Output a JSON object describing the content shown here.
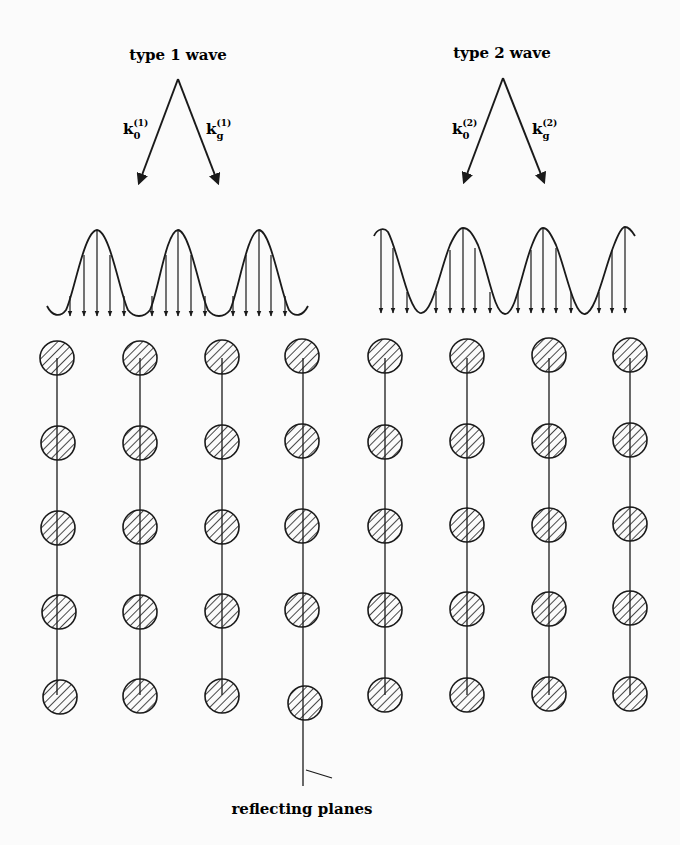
{
  "figure": {
    "type1": {
      "title": "type 1 wave",
      "k0_label": "k",
      "k0_sub": "0",
      "k0_sup": "(1)",
      "kg_label": "k",
      "kg_sub": "g",
      "kg_sup": "(1)"
    },
    "type2": {
      "title": "type 2 wave",
      "k0_label": "k",
      "k0_sub": "0",
      "k0_sup": "(2)",
      "kg_label": "k",
      "kg_sub": "g",
      "kg_sup": "(2)"
    },
    "caption": "reflecting planes",
    "lattice": {
      "columns_x": [
        57,
        140,
        222,
        302,
        385,
        467,
        549,
        630
      ],
      "rows_y": [
        358,
        442,
        526,
        610,
        695
      ],
      "atom_radius": 17,
      "hatch": "diagonal"
    },
    "colors": {
      "ink": "#1a1a1a",
      "paper": "#fbfbfb"
    }
  }
}
